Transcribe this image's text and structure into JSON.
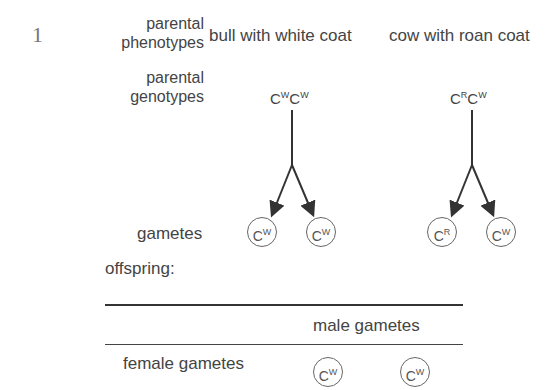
{
  "question_number": "1",
  "labels": {
    "parental_phenotypes": [
      "parental",
      "phenotypes"
    ],
    "parental_genotypes": [
      "parental",
      "genotypes"
    ],
    "gametes": "gametes",
    "offspring": "offspring:"
  },
  "parents": [
    {
      "phenotype": "bull with white coat",
      "genotype": [
        [
          "C",
          "W"
        ],
        [
          "C",
          "W"
        ]
      ],
      "gametes": [
        [
          "C",
          "W"
        ],
        [
          "C",
          "W"
        ]
      ]
    },
    {
      "phenotype": "cow with roan coat",
      "genotype": [
        [
          "C",
          "R"
        ],
        [
          "C",
          "W"
        ]
      ],
      "gametes": [
        [
          "C",
          "R"
        ],
        [
          "C",
          "W"
        ]
      ]
    }
  ],
  "punnett": {
    "column_header": "male gametes",
    "row_header": "female gametes",
    "male_gametes": [
      [
        "C",
        "W"
      ],
      [
        "C",
        "W"
      ]
    ]
  },
  "colors": {
    "text": "#444444",
    "lines": "#333333"
  }
}
